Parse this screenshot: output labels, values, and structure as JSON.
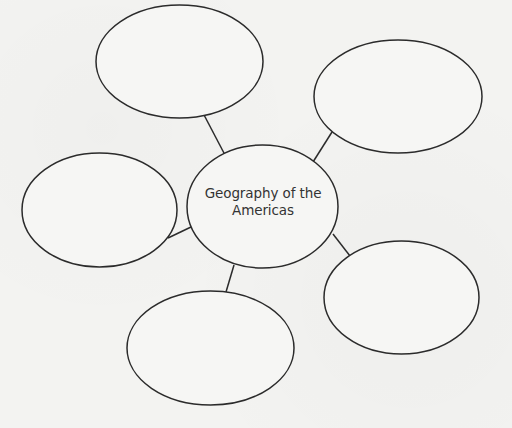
{
  "diagram": {
    "type": "concept-web",
    "center": {
      "label_line1": "Geography of the",
      "label_line2": "Americas"
    },
    "satellites": [
      {
        "position": "top-left",
        "label": ""
      },
      {
        "position": "top-right",
        "label": ""
      },
      {
        "position": "left",
        "label": ""
      },
      {
        "position": "bottom",
        "label": ""
      },
      {
        "position": "bottom-right",
        "label": ""
      }
    ]
  },
  "colors": {
    "background": "#f3f3f1",
    "stroke": "#2b2b2b",
    "text": "#333333"
  }
}
